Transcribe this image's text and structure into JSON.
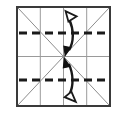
{
  "figure": {
    "name": "paper-fold-diagram",
    "title": "Square fold diagram with vertical fold arrows",
    "background_color": "#ffffff"
  },
  "canvas": {
    "width": 126,
    "height": 114
  },
  "square": {
    "name": "paper-outline",
    "x": 17,
    "y": 7,
    "width": 93,
    "height": 99,
    "stroke_color": "#333333",
    "stroke_width": 2,
    "fill_color": "#ffffff"
  },
  "grid": {
    "vertical_lines": {
      "name": "vertical-gridlines",
      "count": 3,
      "x_positions": [
        40,
        63,
        86
      ],
      "stroke_color": "#9a9a9a",
      "stroke_width": 1,
      "style": "solid"
    },
    "horizontal_center_line": {
      "name": "horizontal-center-line",
      "y": 56,
      "stroke_color": "#9a9a9a",
      "stroke_width": 1,
      "style": "solid"
    }
  },
  "fold_lines": {
    "name": "dashed-fold-lines",
    "style": "dashed",
    "stroke_color": "#1a1a1a",
    "stroke_width": 3,
    "dash_pattern": "7 5",
    "lines": [
      {
        "label": "upper-quarter-fold-line",
        "y": 33
      },
      {
        "label": "lower-quarter-fold-line",
        "y": 80
      }
    ]
  },
  "diagonals": {
    "name": "diagonal-crease-lines",
    "stroke_color": "#8c8c8c",
    "stroke_width": 1,
    "lines": [
      {
        "label": "diagonal-top-left-to-bottom-right",
        "x1": 17,
        "y1": 7,
        "x2": 110,
        "y2": 106
      },
      {
        "label": "diagonal-bottom-left-to-top-right",
        "x1": 17,
        "y1": 106,
        "x2": 110,
        "y2": 7
      }
    ]
  },
  "arrows": [
    {
      "name": "top-fold-arrow",
      "direction": "up-toward-top-edge",
      "hollow_head": "top",
      "solid_head": "bottom",
      "stroke_color": "#1a1a1a",
      "fill_color": "#ffffff",
      "start_y": 14,
      "end_y": 54
    },
    {
      "name": "bottom-fold-arrow",
      "direction": "down-toward-bottom-edge",
      "hollow_head": "bottom",
      "solid_head": "top",
      "stroke_color": "#1a1a1a",
      "fill_color": "#ffffff",
      "start_y": 60,
      "end_y": 100
    }
  ]
}
